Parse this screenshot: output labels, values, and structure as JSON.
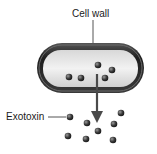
{
  "labels": {
    "cell_wall": "Cell wall",
    "exotoxin": "Exotoxin"
  },
  "colors": {
    "cell_wall": "#2b2b2b",
    "cytoplasm": "#e4e4e4",
    "molecule": "#3a3a3a",
    "arrow": "#4a4a4a",
    "leader_line": "#555555"
  },
  "molecules": {
    "inside": [
      [
        69,
        77
      ],
      [
        81,
        78
      ],
      [
        98,
        65
      ],
      [
        112,
        70
      ],
      [
        105,
        78
      ]
    ],
    "outside": [
      [
        70,
        117
      ],
      [
        87,
        123
      ],
      [
        121,
        113
      ],
      [
        114,
        124
      ],
      [
        98,
        131
      ],
      [
        68,
        136
      ],
      [
        86,
        139
      ],
      [
        113,
        140
      ]
    ]
  }
}
